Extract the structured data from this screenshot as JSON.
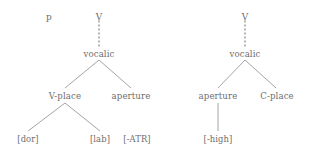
{
  "figure": {
    "type": "feature-geometry-tree-pair",
    "background_color": "#ffffff",
    "text_color": "#6e6e6e",
    "line_color": "#8d8d8d"
  },
  "trees": [
    {
      "id": "left-tree",
      "roots": [
        "p",
        "V"
      ],
      "nodes": {
        "segment_p": "p",
        "segment_v": "V",
        "vocalic": "vocalic",
        "v_place": "V-place",
        "aperture": "aperture",
        "dor": "[dor]",
        "lab": "[lab]",
        "atr": "[-ATR]"
      }
    },
    {
      "id": "right-tree",
      "roots": [
        "V"
      ],
      "nodes": {
        "segment_v": "V",
        "vocalic": "vocalic",
        "aperture": "aperture",
        "c_place": "C-place",
        "high": "[-high]"
      }
    }
  ]
}
